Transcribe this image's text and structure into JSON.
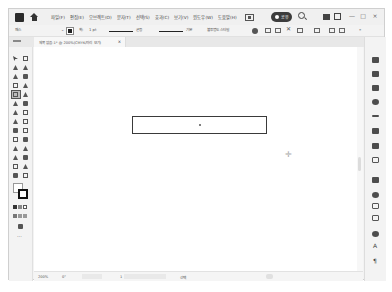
{
  "app": {
    "menubar": {
      "items": [
        "파일(F)",
        "편집(E)",
        "오브젝트(O)",
        "문자(T)",
        "선택(S)",
        "효과(C)",
        "보기(V)",
        "윈도우(W)",
        "도움말(H)"
      ],
      "share_label": "공유",
      "window_controls": [
        "—",
        "□",
        "×"
      ]
    },
    "controlbar": {
      "selection_label": "패스",
      "stroke_label": "획:",
      "stroke_value": "1 pt",
      "brush_label": "균등",
      "profile_label": "기본",
      "style_label": "불투명도 스타일",
      "extra": "»"
    },
    "document_tab": {
      "title": "제목 없음-1* @ 200%(CMYK/미리 보기)",
      "close": "×"
    },
    "toolbar": {
      "more_label": "···"
    },
    "statusbar": {
      "zoom": "200%",
      "angle": "0°",
      "artboard": "1",
      "tool_name": "선택"
    },
    "right_panel": {
      "text_icon": "A",
      "menu_icon": "¶"
    }
  }
}
